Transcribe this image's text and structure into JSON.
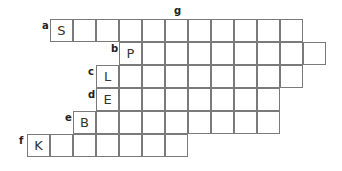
{
  "puzzle": {
    "column_clue": {
      "label": "g",
      "col": 6
    },
    "rows": [
      {
        "clue": "a",
        "start_col": 1,
        "length": 11,
        "letters": [
          "S",
          "",
          "",
          "",
          "",
          "",
          "",
          "",
          "",
          "",
          ""
        ]
      },
      {
        "clue": "b",
        "start_col": 4,
        "length": 9,
        "letters": [
          "P",
          "",
          "",
          "",
          "",
          "",
          "",
          "",
          ""
        ]
      },
      {
        "clue": "c",
        "start_col": 3,
        "length": 9,
        "letters": [
          "L",
          "",
          "",
          "",
          "",
          "",
          "",
          "",
          ""
        ]
      },
      {
        "clue": "d",
        "start_col": 3,
        "length": 8,
        "letters": [
          "E",
          "",
          "",
          "",
          "",
          "",
          "",
          ""
        ]
      },
      {
        "clue": "e",
        "start_col": 2,
        "length": 9,
        "letters": [
          "B",
          "",
          "",
          "",
          "",
          "",
          "",
          "",
          ""
        ]
      },
      {
        "clue": "f",
        "start_col": 0,
        "length": 7,
        "letters": [
          "K",
          "",
          "",
          "",
          "",
          "",
          ""
        ]
      }
    ]
  }
}
